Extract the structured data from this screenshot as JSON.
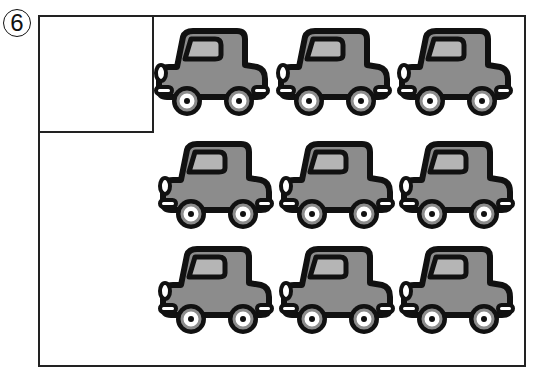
{
  "problem_number": "6",
  "answer_box": {
    "value": ""
  },
  "cars": {
    "count": 9,
    "rows": 3,
    "cols": 3,
    "body_color": "#8c8c8c",
    "window_color": "#b5b5b5",
    "outline_color": "#111111",
    "positions": [
      {
        "x": 153,
        "y": 25
      },
      {
        "x": 275,
        "y": 25
      },
      {
        "x": 396,
        "y": 25
      },
      {
        "x": 157,
        "y": 138
      },
      {
        "x": 278,
        "y": 138
      },
      {
        "x": 398,
        "y": 138
      },
      {
        "x": 157,
        "y": 243
      },
      {
        "x": 278,
        "y": 243
      },
      {
        "x": 398,
        "y": 243
      }
    ]
  }
}
